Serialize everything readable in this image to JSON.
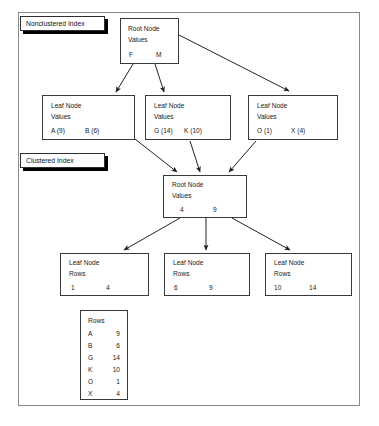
{
  "diagram": {
    "frame_color": "#8a8a8a",
    "box_color": "#3a3a3a",
    "text_color": "#1a1a1a"
  },
  "labels": {
    "nonclustered": "Nonclustered Index",
    "clustered": "Clustered Index"
  },
  "nonclustered": {
    "root": {
      "line1": "Root Node",
      "line2": "Values",
      "key1": "F",
      "key2": "M"
    },
    "leaves": [
      {
        "line1": "Leaf Node",
        "line2": "Values",
        "key1": "A (9)",
        "key2": "B (6)"
      },
      {
        "line1": "Leaf Node",
        "line2": "Values",
        "key1": "G (14)",
        "key2": "K (10)"
      },
      {
        "line1": "Leaf Node",
        "line2": "Values",
        "key1": "O (1)",
        "key2": "X (4)"
      }
    ]
  },
  "clustered": {
    "root": {
      "line1": "Root Node",
      "line2": "Values",
      "key1": "4",
      "key2": "9"
    },
    "leaves": [
      {
        "line1": "Leaf Node",
        "line2": "Rows",
        "key1": "1",
        "key2": "4"
      },
      {
        "line1": "Leaf Node",
        "line2": "Rows",
        "key1": "6",
        "key2": "9"
      },
      {
        "line1": "Leaf Node",
        "line2": "Rows",
        "key1": "10",
        "key2": "14"
      }
    ]
  },
  "rows_table": {
    "header": "Rows",
    "rows": [
      {
        "key": "A",
        "value": "9"
      },
      {
        "key": "B",
        "value": "6"
      },
      {
        "key": "G",
        "value": "14"
      },
      {
        "key": "K",
        "value": "10"
      },
      {
        "key": "O",
        "value": "1"
      },
      {
        "key": "X",
        "value": "4"
      }
    ]
  }
}
